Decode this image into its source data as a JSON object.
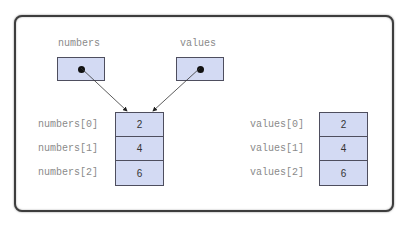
{
  "diagram": {
    "references": [
      {
        "name": "numbers",
        "points_to": "array_0"
      },
      {
        "name": "values",
        "points_to": "array_0"
      }
    ],
    "arrays": [
      {
        "id": "array_0",
        "labels": [
          "numbers[0]",
          "numbers[1]",
          "numbers[2]"
        ],
        "values": [
          "2",
          "4",
          "6"
        ]
      },
      {
        "id": "array_1",
        "labels": [
          "values[0]",
          "values[1]",
          "values[2]"
        ],
        "values": [
          "2",
          "4",
          "6"
        ]
      }
    ],
    "colors": {
      "cell_fill": "#d3daf3",
      "cell_border": "#4e4e5e",
      "label_text": "#8a8a8a",
      "frame_border": "#3d3d3d"
    }
  }
}
